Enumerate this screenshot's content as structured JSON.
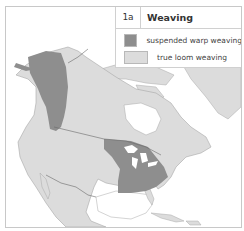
{
  "legend": {
    "number": "1a",
    "title": "Weaving",
    "items": [
      {
        "label": "suspended warp weaving",
        "color": "#8e8e8e"
      },
      {
        "label": "true loom weaving",
        "color": "#dcdcdc"
      }
    ]
  },
  "colors": {
    "land": "#dcdcdc",
    "suspended_warp": "#8e8e8e",
    "water": "#ffffff",
    "border_line": "#6a6a6a",
    "coast": "#a8a8a8"
  },
  "regions": [
    {
      "name": "northwest-coast",
      "category": "suspended warp weaving"
    },
    {
      "name": "eastern-woodlands",
      "category": "suspended warp weaving"
    }
  ]
}
